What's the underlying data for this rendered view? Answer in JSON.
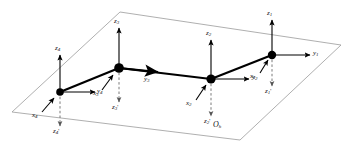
{
  "figure": {
    "type": "kinematic-chain-coordinate-frames",
    "plane_label": "O",
    "plane_label_sub": "h",
    "colors": {
      "plane_stroke": "#9a9a9a",
      "link": "#000000",
      "axis": "#000000",
      "dashed_axis": "#7a7a7a",
      "joint": "#000000",
      "background": "#ffffff"
    },
    "plane_corners": [
      {
        "x": 120,
        "y": 12
      },
      {
        "x": 341,
        "y": 45
      },
      {
        "x": 240,
        "y": 140
      },
      {
        "x": 12,
        "y": 112
      }
    ],
    "joints": [
      {
        "id": "1",
        "x": 272,
        "y": 55
      },
      {
        "id": "2",
        "x": 211,
        "y": 79
      },
      {
        "id": "3",
        "x": 119,
        "y": 68
      },
      {
        "id": "4",
        "x": 60,
        "y": 92
      }
    ],
    "links": [
      {
        "from": "4",
        "to": "3"
      },
      {
        "from": "3",
        "to": "2"
      },
      {
        "from": "2",
        "to": "1"
      }
    ],
    "frames": [
      {
        "id": "1",
        "z_label": "z",
        "z_sub": "1",
        "y_label": "y",
        "y_sub": "1",
        "x_label": "x",
        "x_sub": "1",
        "zp_label": "z",
        "zp_sub": "1",
        "zp_prime": "'"
      },
      {
        "id": "2",
        "z_label": "z",
        "z_sub": "2",
        "y_label": "y",
        "y_sub": "2",
        "x_label": "x",
        "x_sub": "2",
        "zp_label": "z",
        "zp_sub": "2",
        "zp_prime": "'"
      },
      {
        "id": "3",
        "z_label": "z",
        "z_sub": "3",
        "y_label": "y",
        "y_sub": "3",
        "x_label": "x",
        "x_sub": "3",
        "zp_label": "z",
        "zp_sub": "3",
        "zp_prime": "'"
      },
      {
        "id": "4",
        "z_label": "z",
        "z_sub": "4",
        "y_label": "y",
        "y_sub": "4",
        "x_label": "x",
        "x_sub": "4",
        "zp_label": "z",
        "zp_sub": "4",
        "zp_prime": "'"
      }
    ]
  }
}
